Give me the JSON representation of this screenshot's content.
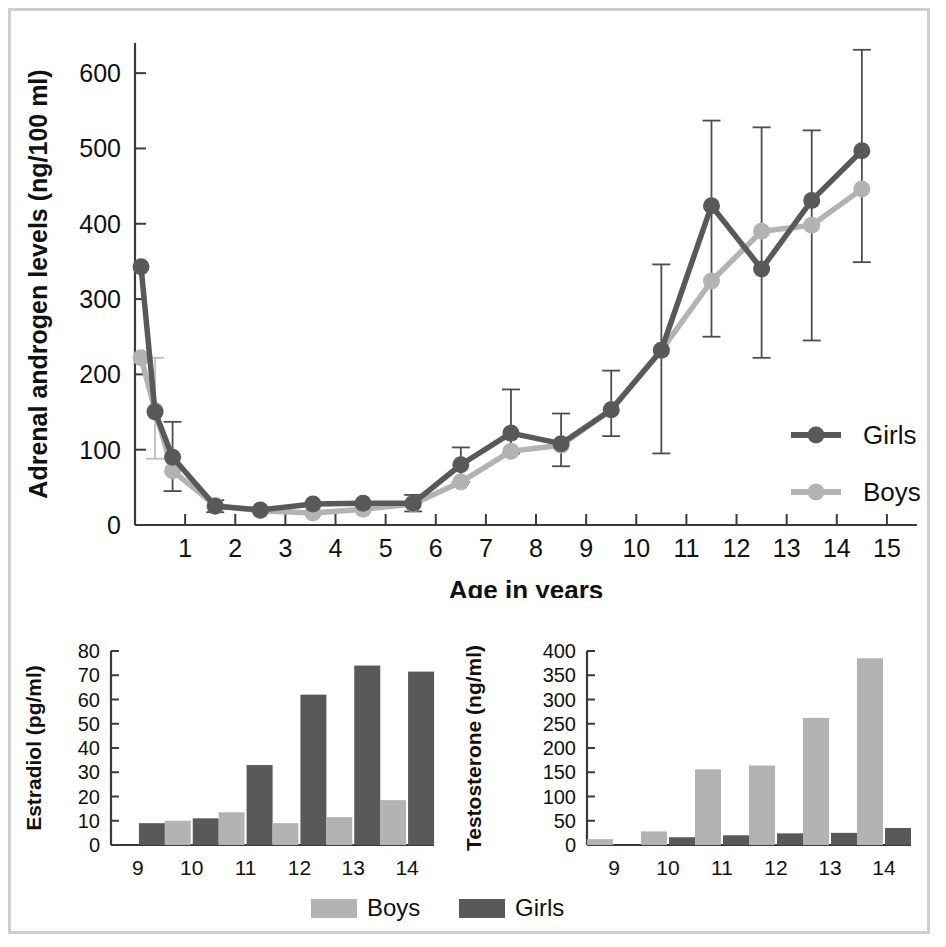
{
  "figure": {
    "background": "#ffffff",
    "frame_color": "#cfcfcf",
    "colors": {
      "girls": "#595959",
      "boys": "#b3b3b3",
      "girls_err": "#4d4d4d",
      "boys_err": "#bdbdbd",
      "axis": "#3a3a3a",
      "text": "#111111"
    }
  },
  "chart_data": [
    {
      "id": "adrenal-androgen-line-chart",
      "type": "line",
      "title": "",
      "xlabel": "Age in years",
      "ylabel": "Adrenal androgen levels (ng/100 ml)",
      "xlim": [
        0,
        15.6
      ],
      "ylim": [
        0,
        640
      ],
      "xticks": [
        1,
        2,
        3,
        4,
        5,
        6,
        7,
        8,
        9,
        10,
        11,
        12,
        13,
        14,
        15
      ],
      "xticklabels": [
        "1",
        "2",
        "3",
        "4",
        "5",
        "6",
        "7",
        "8",
        "9",
        "10",
        "11",
        "12",
        "13",
        "14",
        "15"
      ],
      "yticks": [
        0,
        100,
        200,
        300,
        400,
        500,
        600
      ],
      "yticklabels": [
        "0",
        "100",
        "200",
        "300",
        "400",
        "500",
        "600"
      ],
      "grid": false,
      "legend_position": "right-inside",
      "x": [
        0.12,
        0.4,
        0.75,
        1.6,
        2.5,
        3.55,
        4.55,
        5.55,
        6.5,
        7.5,
        8.5,
        9.5,
        10.5,
        11.5,
        12.5,
        13.5,
        14.5
      ],
      "series": [
        {
          "name": "Girls",
          "color": "#595959",
          "values": [
            343,
            150,
            90,
            25,
            20,
            28,
            29,
            29,
            80,
            122,
            108,
            153,
            232,
            424,
            340,
            431,
            497
          ],
          "err_low": [
            null,
            null,
            45,
            17,
            null,
            null,
            null,
            18,
            57,
            95,
            78,
            118,
            95,
            250,
            222,
            245,
            349
          ],
          "err_high": [
            null,
            null,
            137,
            33,
            null,
            null,
            null,
            40,
            103,
            180,
            148,
            205,
            346,
            537,
            528,
            524,
            631
          ]
        },
        {
          "name": "Boys",
          "color": "#b3b3b3",
          "values": [
            222,
            152,
            72,
            26,
            19,
            16,
            21,
            28,
            57,
            98,
            106,
            153,
            232,
            324,
            390,
            398,
            446
          ],
          "err_low": [
            null,
            88,
            null,
            null,
            null,
            null,
            null,
            null,
            null,
            null,
            null,
            null,
            null,
            null,
            null,
            null,
            null
          ],
          "err_high": [
            null,
            222,
            null,
            null,
            null,
            null,
            null,
            null,
            null,
            null,
            null,
            null,
            null,
            null,
            null,
            null,
            null
          ]
        }
      ],
      "legend": [
        {
          "label": "Girls",
          "color": "#595959"
        },
        {
          "label": "Boys",
          "color": "#b3b3b3"
        }
      ]
    },
    {
      "id": "estradiol-bar-chart",
      "type": "bar",
      "title": "",
      "xlabel": "Age in years",
      "ylabel": "Estradiol (pg/ml)",
      "categories": [
        "9",
        "10",
        "11",
        "12",
        "13",
        "14"
      ],
      "yticks": [
        0,
        10,
        20,
        30,
        40,
        50,
        60,
        70,
        80
      ],
      "yticklabels": [
        "0",
        "10",
        "20",
        "30",
        "40",
        "50",
        "60",
        "70",
        "80"
      ],
      "ylim": [
        0,
        80
      ],
      "grid": false,
      "series": [
        {
          "name": "Boys",
          "color": "#b3b3b3",
          "values": [
            0,
            10,
            13.5,
            9,
            11.5,
            18.5
          ]
        },
        {
          "name": "Girls",
          "color": "#595959",
          "values": [
            9,
            11,
            33,
            62,
            74,
            71.5
          ]
        }
      ]
    },
    {
      "id": "testosterone-bar-chart",
      "type": "bar",
      "title": "",
      "xlabel": "Age in years",
      "ylabel": "Testosterone (ng/ml)",
      "categories": [
        "9",
        "10",
        "11",
        "12",
        "13",
        "14"
      ],
      "yticks": [
        0,
        50,
        100,
        150,
        200,
        250,
        300,
        350,
        400
      ],
      "yticklabels": [
        "0",
        "50",
        "100",
        "150",
        "200",
        "250",
        "300",
        "350",
        "400"
      ],
      "ylim": [
        0,
        400
      ],
      "grid": false,
      "series": [
        {
          "name": "Boys",
          "color": "#b3b3b3",
          "values": [
            12,
            28,
            156,
            164,
            262,
            385
          ]
        },
        {
          "name": "Girls",
          "color": "#595959",
          "values": [
            0,
            16,
            20,
            24,
            25,
            35
          ]
        }
      ]
    }
  ],
  "bottom_legend": {
    "items": [
      {
        "label": "Boys",
        "color": "#b3b3b3"
      },
      {
        "label": "Girls",
        "color": "#595959"
      }
    ]
  }
}
